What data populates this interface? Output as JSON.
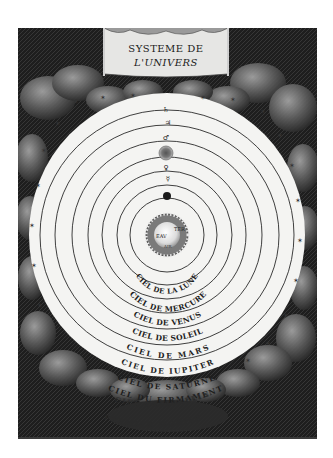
{
  "engraving": {
    "title_line1": "SYSTEME DE",
    "title_line2": "L'UNIVERS",
    "earth": {
      "labels": [
        "TER",
        "EAV",
        "AIR"
      ]
    },
    "spheres": [
      {
        "label": "CIEL DE LA LUNE",
        "planet_symbol": "☽"
      },
      {
        "label": "CIEL DE MERCURE",
        "planet_symbol": "☿"
      },
      {
        "label": "CIEL DE VENUS",
        "planet_symbol": "♀"
      },
      {
        "label": "CIEL DE SOLEIL",
        "planet_symbol": "☉"
      },
      {
        "label": "CIEL DE MARS",
        "planet_symbol": "♂"
      },
      {
        "label": "CIEL DE IUPITER",
        "planet_symbol": "♃"
      },
      {
        "label": "CIEL DE SATURNE",
        "planet_symbol": "♄"
      },
      {
        "label": "CIEL DU FIRMAMENT",
        "planet_symbol": ""
      }
    ],
    "outer_labels": [
      "CIEL CRISTALLIN",
      "PREMIER MOBILE"
    ],
    "colors": {
      "clouds_dark": "#1c1c1c",
      "clouds_mid": "#5a5a5a",
      "clouds_light": "#9a9a9a",
      "heaven": "#f4f4f2",
      "ink": "#222222"
    }
  }
}
